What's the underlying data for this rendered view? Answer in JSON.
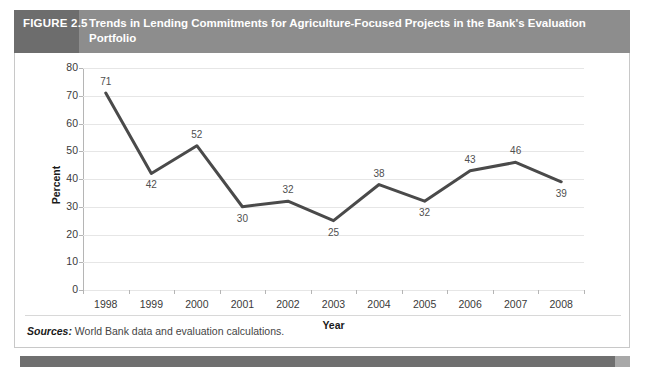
{
  "figure": {
    "number_label": "FIGURE 2.5",
    "title": "Trends in Lending Commitments for Agriculture-Focused Projects in the Bank's Evaluation Portfolio"
  },
  "source": {
    "label": "Sources:",
    "text": " World Bank data and evaluation calculations."
  },
  "colors": {
    "header_band": "#8d8d8d",
    "header_number_block": "#6d6d6d",
    "series_line": "#4a4a4a",
    "gridline": "#e6e6e6",
    "axis": "#b5b5b5",
    "bottom_bar_dark": "#6f6f6f",
    "bottom_bar_light": "#a8a8a8"
  },
  "chart_data": {
    "type": "line",
    "title": "Trends in Lending Commitments for Agriculture-Focused Projects in the Bank's Evaluation Portfolio",
    "xlabel": "Year",
    "ylabel": "Percent",
    "categories": [
      "1998",
      "1999",
      "2000",
      "2001",
      "2002",
      "2003",
      "2004",
      "2005",
      "2006",
      "2007",
      "2008"
    ],
    "values": [
      71,
      42,
      52,
      30,
      32,
      25,
      38,
      32,
      43,
      46,
      39
    ],
    "label_positions": [
      "above",
      "below",
      "above",
      "below",
      "above",
      "below",
      "above",
      "below",
      "above",
      "above",
      "below"
    ],
    "ylim": [
      0,
      80
    ],
    "yticks": [
      0,
      10,
      20,
      30,
      40,
      50,
      60,
      70,
      80
    ],
    "grid": true,
    "legend": "none",
    "series": [
      {
        "name": "Agriculture-focused share of evaluation portfolio",
        "values": [
          71,
          42,
          52,
          30,
          32,
          25,
          38,
          32,
          43,
          46,
          39
        ]
      }
    ]
  }
}
